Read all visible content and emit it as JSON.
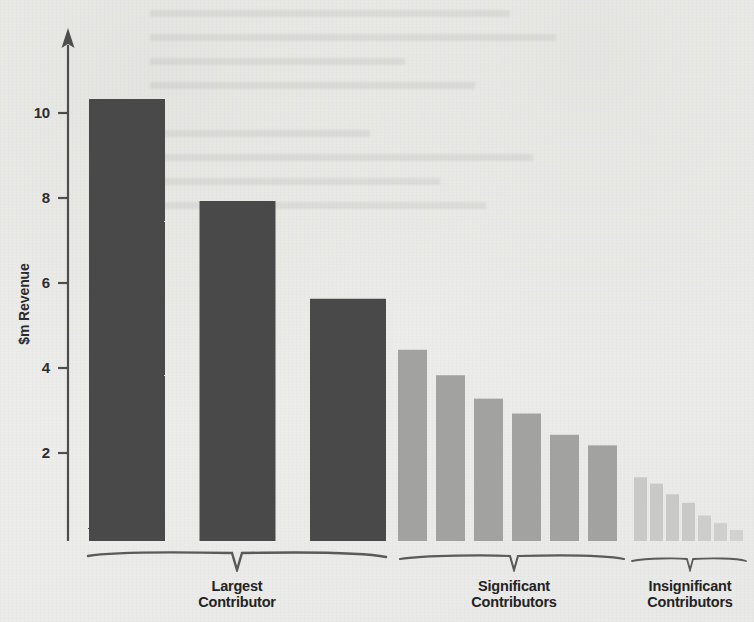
{
  "chart_data": {
    "type": "bar",
    "title": "",
    "xlabel": "",
    "ylabel": "$m Revenue",
    "ylim": [
      0,
      11.6
    ],
    "grid": false,
    "legend": "none",
    "y_ticks": [
      {
        "value": 10,
        "label": "10"
      },
      {
        "value": 8,
        "label": "8"
      },
      {
        "value": 6,
        "label": "6"
      },
      {
        "value": 4,
        "label": "4"
      },
      {
        "value": 2,
        "label": "2"
      }
    ],
    "categories": [
      "1",
      "2",
      "3",
      "4",
      "5",
      "6",
      "7",
      "8",
      "9",
      "10",
      "11",
      "12",
      "13",
      "14",
      "15",
      "16"
    ],
    "values": [
      10.4,
      8.0,
      5.7,
      4.5,
      3.9,
      3.35,
      3.0,
      2.5,
      2.25,
      1.5,
      1.35,
      1.1,
      0.9,
      0.6,
      0.42,
      0.26
    ],
    "groups": [
      {
        "name": "largest-contributor",
        "label_line1": "Largest",
        "label_line2": "Contributor",
        "color": "#4a4a4a",
        "bar_count": 3,
        "values": [
          10.4,
          8.0,
          5.7
        ]
      },
      {
        "name": "significant-contributors",
        "label_line1": "Significant",
        "label_line2": "Contributors",
        "color": "#a2a2a0",
        "bar_count": 6,
        "values": [
          4.5,
          3.9,
          3.35,
          3.0,
          2.5,
          2.25
        ]
      },
      {
        "name": "insignificant-contributors",
        "label_line1": "Insignificant",
        "label_line2": "Contributors",
        "color": "#c9c9c7",
        "bar_count": 7,
        "values": [
          1.5,
          1.35,
          1.1,
          0.9,
          0.6,
          0.42,
          0.26
        ]
      }
    ]
  },
  "axis": {
    "y_title": "$m Revenue",
    "tick_10": "10",
    "tick_8": "8",
    "tick_6": "6",
    "tick_4": "4",
    "tick_2": "2"
  },
  "groups": {
    "largest": {
      "line1": "Largest",
      "line2": "Contributor"
    },
    "significant": {
      "line1": "Significant",
      "line2": "Contributors"
    },
    "insignificant": {
      "line1": "Insignificant",
      "line2": "Contributors"
    }
  },
  "colors": {
    "dark_bar": "#4a4a4a",
    "medium_bar": "#a2a2a0",
    "light_bar": "#c9c9c7",
    "axis": "#4e4e4e",
    "background": "#eeeeec",
    "text": "#232323"
  }
}
